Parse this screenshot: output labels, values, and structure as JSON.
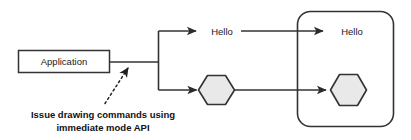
{
  "diagram": {
    "colors": {
      "stroke": "#333333",
      "text": "#1a1a1a",
      "hexagon_fill": "#e9e9e9",
      "box_fill": "#ffffff",
      "background": "#ffffff"
    },
    "nodes": {
      "application_box": {
        "label": "Application",
        "shape": "rectangle"
      },
      "hello_middle": {
        "label": "Hello",
        "shape": "text"
      },
      "hello_right": {
        "label": "Hello",
        "shape": "text"
      },
      "hexagon_middle": {
        "label": "",
        "shape": "hexagon"
      },
      "hexagon_right": {
        "label": "",
        "shape": "hexagon"
      },
      "display_surface": {
        "label": "",
        "shape": "rounded-rectangle"
      }
    },
    "annotation": {
      "line1": "Issue drawing commands using",
      "line2": "immediate mode API",
      "leader_style": "dotted-arrow"
    }
  }
}
